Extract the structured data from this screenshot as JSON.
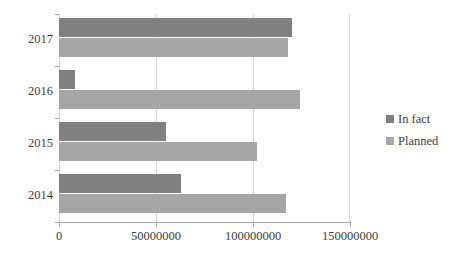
{
  "chart_data": {
    "type": "bar",
    "orientation": "horizontal",
    "title": "",
    "xlabel": "",
    "ylabel": "",
    "categories": [
      "2014",
      "2015",
      "2016",
      "2017"
    ],
    "category_order_top_to_bottom": [
      "2017",
      "2016",
      "2015",
      "2014"
    ],
    "series": [
      {
        "name": "In fact",
        "color": "#808080",
        "values": [
          63000000,
          55000000,
          8000000,
          120000000
        ]
      },
      {
        "name": "Planned",
        "color": "#a6a6a6",
        "values": [
          117000000,
          102000000,
          124000000,
          118000000
        ]
      }
    ],
    "xlim": [
      0,
      150000000
    ],
    "xticks": [
      0,
      50000000,
      100000000,
      150000000
    ],
    "xtick_labels": [
      "0",
      "50000000",
      "100000000",
      "150000000"
    ],
    "grid": true,
    "grid_axis": "x",
    "legend_position": "right"
  },
  "legend": {
    "items": [
      {
        "label": "In fact",
        "color": "#808080"
      },
      {
        "label": "Planned",
        "color": "#a6a6a6"
      }
    ]
  },
  "axis": {
    "y_categories": [
      "2017",
      "2016",
      "2015",
      "2014"
    ],
    "x_tick_labels": [
      "0",
      "50000000",
      "100000000",
      "150000000"
    ]
  },
  "colors": {
    "in_fact": "#808080",
    "planned": "#a6a6a6",
    "gridline": "#d6d6d6",
    "axis": "#a6a6a6",
    "text": "#3d3d3d",
    "background": "#ffffff"
  }
}
